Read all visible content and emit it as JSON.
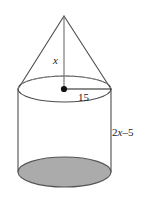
{
  "figure": {
    "name": "composite-solid-cone-on-cylinder",
    "labels": {
      "cone_height": "x",
      "radius": "15",
      "cylinder_height_prefix": "2",
      "cylinder_height_var": "x",
      "cylinder_height_suffix": "–5"
    },
    "colors": {
      "outline": "#4d4d4d",
      "shaded_base_fill": "#ababab",
      "shaded_base_stroke": "#545454",
      "hidden_edge": "#8c8c8c",
      "dimension_line": "#1a1a1a",
      "center_dot": "#111111",
      "background": "#ffffff",
      "label_text": "#1a1a1a"
    },
    "geometry": {
      "apex": {
        "x": 64,
        "y": 16
      },
      "cone_base_center": {
        "x": 64.5,
        "y": 89
      },
      "ellipse_rx": 46.5,
      "top_ellipse_ry": 13,
      "bottom_ellipse_center": {
        "x": 64.5,
        "y": 172
      },
      "bottom_ellipse_ry": 15,
      "cylinder_left_x": 18,
      "cylinder_right_x": 111,
      "cylinder_top_y": 89,
      "cylinder_bottom_y": 172
    }
  }
}
